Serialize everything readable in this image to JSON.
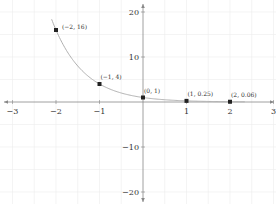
{
  "chart_data": {
    "type": "line",
    "title": "",
    "function": "y = 4^(-x)",
    "xlabel": "",
    "ylabel": "",
    "xlim": [
      -3,
      3
    ],
    "ylim": [
      -20,
      20
    ],
    "x_ticks": [
      -3,
      -2,
      -1,
      1,
      2,
      3
    ],
    "x_tick_labels": [
      "−3",
      "−2",
      "−1",
      "1",
      "2",
      "3"
    ],
    "y_ticks": [
      20,
      10,
      -10,
      -20
    ],
    "y_tick_labels": [
      "20",
      "10",
      "−10",
      "−20"
    ],
    "grid": true,
    "legend": null,
    "series": [
      {
        "name": "curve",
        "points": [
          {
            "x": -2,
            "y": 16,
            "label": "(−2, 16)"
          },
          {
            "x": -1,
            "y": 4,
            "label": "(−1, 4)"
          },
          {
            "x": 0,
            "y": 1,
            "label": "(0, 1)"
          },
          {
            "x": 1,
            "y": 0.25,
            "label": "(1, 0.25)"
          },
          {
            "x": 2,
            "y": 0.06,
            "label": "(2, 0.06)"
          }
        ]
      }
    ],
    "colors": {
      "curve": "#b0b0b0",
      "points": "#222222",
      "axes": "#888888",
      "grid": "#ececec"
    }
  }
}
